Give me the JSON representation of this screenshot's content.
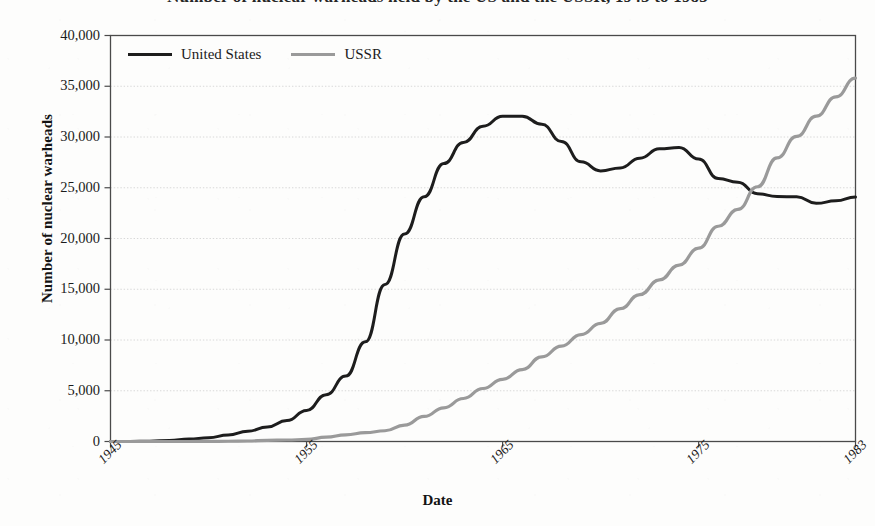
{
  "figure": {
    "title": "Number of nuclear warheads held by the US and the USSR, 1945 to 1983",
    "title_note": "title is cropped at the top edge of the screenshot"
  },
  "legend": {
    "position": "top-left-inside",
    "entries": [
      {
        "label": "United States",
        "color": "#1d1d1d",
        "swatch": "line-swatch-us"
      },
      {
        "label": "USSR",
        "color": "#9a9a9a",
        "swatch": "line-swatch-ussr"
      }
    ]
  },
  "axes": {
    "xlabel": "Date",
    "ylabel": "Number of nuclear warheads",
    "yticks": [
      "40,000",
      "35,000",
      "30,000",
      "25,000",
      "20,000",
      "15,000",
      "10,000",
      "5,000",
      "0"
    ],
    "xticks": [
      "1945",
      "1955",
      "1965",
      "1975",
      "1983"
    ]
  },
  "chart_data": {
    "type": "line",
    "title": "Number of nuclear warheads held by the US and the USSR, 1945 to 1983",
    "xlabel": "Date",
    "ylabel": "Number of nuclear warheads",
    "xlim": [
      1945,
      1983
    ],
    "ylim": [
      0,
      40000
    ],
    "xticks": [
      1945,
      1955,
      1965,
      1975,
      1983
    ],
    "yticks": [
      0,
      5000,
      10000,
      15000,
      20000,
      25000,
      30000,
      35000,
      40000
    ],
    "grid": "horizontal-dotted-faint",
    "legend_position": "upper left",
    "x": [
      1945,
      1946,
      1947,
      1948,
      1949,
      1950,
      1951,
      1952,
      1953,
      1954,
      1955,
      1956,
      1957,
      1958,
      1959,
      1960,
      1961,
      1962,
      1963,
      1964,
      1965,
      1966,
      1967,
      1968,
      1969,
      1970,
      1971,
      1972,
      1973,
      1974,
      1975,
      1976,
      1977,
      1978,
      1979,
      1980,
      1981,
      1982,
      1983
    ],
    "series": [
      {
        "name": "United States",
        "color": "#1d1d1d",
        "values": [
          6,
          11,
          32,
          110,
          235,
          369,
          640,
          1005,
          1436,
          2063,
          3057,
          4618,
          6444,
          9822,
          15468,
          20434,
          24111,
          27387,
          29459,
          31056,
          32040,
          32040,
          31255,
          29561,
          27552,
          26662,
          26956,
          27912,
          28834,
          28965,
          27826,
          25914,
          25542,
          24418,
          24138,
          24104,
          23464,
          23708,
          24099
        ]
      },
      {
        "name": "USSR",
        "color": "#9a9a9a",
        "values": [
          0,
          0,
          0,
          0,
          1,
          5,
          25,
          50,
          120,
          150,
          200,
          426,
          660,
          869,
          1060,
          1605,
          2471,
          3322,
          4238,
          5221,
          6129,
          7089,
          8339,
          9399,
          10538,
          11643,
          13092,
          14478,
          15915,
          17385,
          19055,
          21205,
          22869,
          25099,
          27935,
          30062,
          32049,
          33952,
          35804
        ]
      }
    ]
  }
}
